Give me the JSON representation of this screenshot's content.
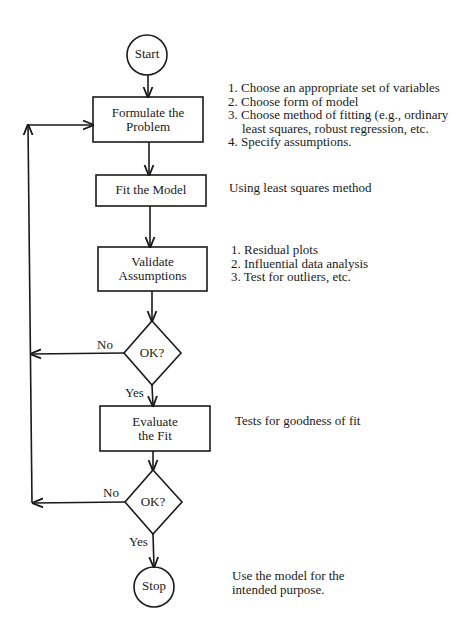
{
  "nodes": {
    "start": "Start",
    "formulate": [
      "Formulate the",
      "Problem"
    ],
    "fit": "Fit the Model",
    "validate": [
      "Validate",
      "Assumptions"
    ],
    "decision1": "OK?",
    "evaluate": [
      "Evaluate",
      "the Fit"
    ],
    "decision2": "OK?",
    "stop": "Stop"
  },
  "edge_labels": {
    "d1_no": "No",
    "d1_yes": "Yes",
    "d2_no": "No",
    "d2_yes": "Yes"
  },
  "notes": {
    "formulate": [
      "1. Choose an appropriate set of variables",
      "2. Choose form of model",
      "3. Choose method of fitting (e.g., ordinary",
      "least squares, robust regression, etc.",
      "4. Specify assumptions."
    ],
    "fit": "Using least squares method",
    "validate": [
      "1. Residual plots",
      "2. Influential data analysis",
      "3. Test for outliers, etc."
    ],
    "evaluate": "Tests for goodness of fit",
    "stop": [
      "Use the model for the",
      "intended purpose."
    ]
  },
  "colors": {
    "stroke": "#1a1a1a",
    "background": "#ffffff"
  }
}
